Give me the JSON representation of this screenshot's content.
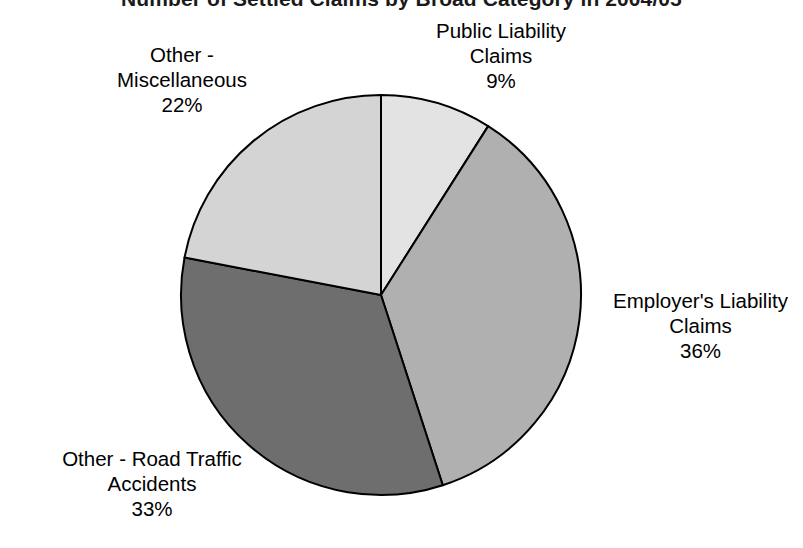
{
  "chart_data": {
    "type": "pie",
    "title": "Number of Settled Claims by Broad Category in 2004/05",
    "categories": [
      "Public Liability Claims",
      "Employer's Liability Claims",
      "Other - Road Traffic Accidents",
      "Other - Miscellaneous"
    ],
    "values": [
      9,
      36,
      33,
      22
    ],
    "value_labels": [
      "9%",
      "36%",
      "33%",
      "22%"
    ],
    "units": "percent",
    "start_angle_deg": 0,
    "direction": "clockwise",
    "legend": "none",
    "grid": false,
    "slice_colors": [
      "#e3e3e3",
      "#b0b0b0",
      "#6e6e6e",
      "#d4d4d4"
    ],
    "outline_color": "#000000"
  },
  "labels": {
    "public_liability": {
      "line1": "Public Liability",
      "line2": "Claims",
      "value": "9%"
    },
    "employers_liability": {
      "line1": "Employer's Liability",
      "line2": "Claims",
      "value": "36%"
    },
    "road_traffic": {
      "line1": "Other - Road Traffic",
      "line2": "Accidents",
      "value": "33%"
    },
    "miscellaneous": {
      "line1": "Other -",
      "line2": "Miscellaneous",
      "value": "22%"
    }
  }
}
